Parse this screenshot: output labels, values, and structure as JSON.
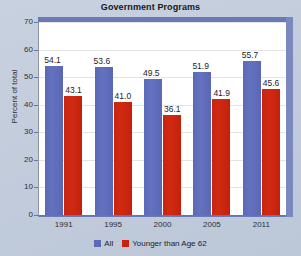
{
  "chart_data": {
    "type": "bar",
    "title": "Government Programs",
    "xlabel": "",
    "ylabel": "Percent of total",
    "categories": [
      "1991",
      "1995",
      "2000",
      "2005",
      "2011"
    ],
    "ylim": [
      0,
      70
    ],
    "yticks": [
      "0",
      "10",
      "20",
      "30",
      "40",
      "50",
      "60",
      "70"
    ],
    "grid": true,
    "legend_position": "bottom",
    "series": [
      {
        "name": "All",
        "color": "#5c69b8",
        "values": [
          54.1,
          53.6,
          49.5,
          51.9,
          55.7
        ],
        "labels": [
          "54.1",
          "53.6",
          "49.5",
          "51.9",
          "55.7"
        ]
      },
      {
        "name": "Younger than Age 62",
        "color": "#c92410",
        "values": [
          43.1,
          41.0,
          36.1,
          41.9,
          45.6
        ],
        "labels": [
          "43.1",
          "41.0",
          "36.1",
          "41.9",
          "45.6"
        ]
      }
    ]
  }
}
